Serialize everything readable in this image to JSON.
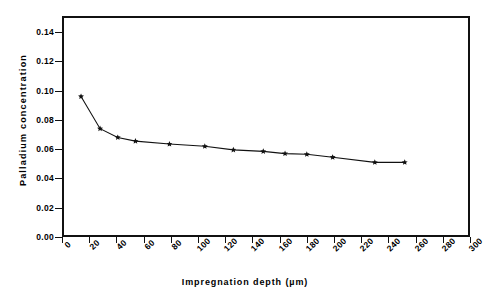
{
  "chart_data": {
    "type": "line",
    "title": "",
    "xlabel": "Impregnation depth (µm)",
    "ylabel": "Palladium  concentration",
    "xlim": [
      0,
      300
    ],
    "ylim": [
      0.0,
      0.151
    ],
    "xticks": [
      0,
      20,
      40,
      60,
      80,
      100,
      120,
      140,
      160,
      180,
      200,
      220,
      240,
      260,
      280,
      300
    ],
    "xticklabels": [
      "0",
      "20",
      "40",
      "60",
      "80",
      "100",
      "120",
      "140",
      "160",
      "180",
      "200",
      "220",
      "240",
      "260",
      "280",
      "300"
    ],
    "yticks": [
      0.0,
      0.02,
      0.04,
      0.06,
      0.08,
      0.1,
      0.12,
      0.14
    ],
    "yticklabels": [
      "0.00",
      "0.02",
      "0.04",
      "0.06",
      "0.08",
      "0.10",
      "0.12",
      "0.14"
    ],
    "grid": false,
    "legend": false,
    "marker": "star",
    "line_color": "#111111",
    "series": [
      {
        "name": "Palladium concentration profile",
        "x": [
          14,
          28,
          41,
          54,
          79,
          105,
          126,
          148,
          164,
          180,
          199,
          230,
          252
        ],
        "y": [
          0.096,
          0.074,
          0.068,
          0.0655,
          0.0635,
          0.062,
          0.0595,
          0.0585,
          0.057,
          0.0565,
          0.0545,
          0.051,
          0.051
        ]
      }
    ]
  },
  "axis": {
    "x_title": "Impregnation depth (µm)",
    "y_title": "Palladium  concentration"
  }
}
